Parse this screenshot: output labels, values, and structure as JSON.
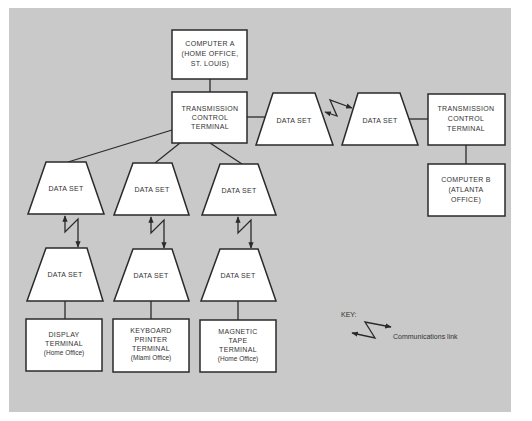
{
  "colors": {
    "background": "#ffffff",
    "panel": "#c9c9c9",
    "node_fill": "#ffffff",
    "stroke": "#2a2a2a",
    "text": "#333333"
  },
  "nodes": {
    "computer_a": {
      "lines": [
        "COMPUTER A",
        "(HOME OFFICE,",
        "ST. LOUIS)"
      ]
    },
    "tct_left": {
      "lines": [
        "TRANSMISSION",
        "CONTROL",
        "TERMINAL"
      ]
    },
    "data_set_top_left": {
      "label": "DATA SET"
    },
    "data_set_top_right": {
      "label": "DATA SET"
    },
    "tct_right": {
      "lines": [
        "TRANSMISSION",
        "CONTROL",
        "TERMINAL"
      ]
    },
    "computer_b": {
      "lines": [
        "COMPUTER B",
        "(ATLANTA",
        "OFFICE)"
      ]
    },
    "data_set_col1_upper": {
      "label": "DATA SET"
    },
    "data_set_col1_lower": {
      "label": "DATA SET"
    },
    "data_set_col2_upper": {
      "label": "DATA SET"
    },
    "data_set_col2_lower": {
      "label": "DATA SET"
    },
    "data_set_col3_upper": {
      "label": "DATA SET"
    },
    "data_set_col3_lower": {
      "label": "DATA SET"
    },
    "display_terminal": {
      "lines": [
        "DISPLAY",
        "TERMINAL",
        "(Home Office)"
      ]
    },
    "keyboard_printer_terminal": {
      "lines": [
        "KEYBOARD",
        "PRINTER",
        "TERMINAL",
        "(Miami Office)"
      ]
    },
    "magnetic_tape_terminal": {
      "lines": [
        "MAGNETIC",
        "TAPE",
        "TERMINAL",
        "(Home Office)"
      ]
    }
  },
  "edges": [
    {
      "from": "computer_a",
      "to": "tct_left",
      "type": "line"
    },
    {
      "from": "tct_left",
      "to": "data_set_top_left",
      "type": "line"
    },
    {
      "from": "data_set_top_left",
      "to": "data_set_top_right",
      "type": "communications-link"
    },
    {
      "from": "data_set_top_right",
      "to": "tct_right",
      "type": "line"
    },
    {
      "from": "tct_right",
      "to": "computer_b",
      "type": "line"
    },
    {
      "from": "tct_left",
      "to": "data_set_col1_upper",
      "type": "line"
    },
    {
      "from": "tct_left",
      "to": "data_set_col2_upper",
      "type": "line"
    },
    {
      "from": "tct_left",
      "to": "data_set_col3_upper",
      "type": "line"
    },
    {
      "from": "data_set_col1_upper",
      "to": "data_set_col1_lower",
      "type": "communications-link"
    },
    {
      "from": "data_set_col2_upper",
      "to": "data_set_col2_lower",
      "type": "communications-link"
    },
    {
      "from": "data_set_col3_upper",
      "to": "data_set_col3_lower",
      "type": "communications-link"
    },
    {
      "from": "data_set_col1_lower",
      "to": "display_terminal",
      "type": "line"
    },
    {
      "from": "data_set_col2_lower",
      "to": "keyboard_printer_terminal",
      "type": "line"
    },
    {
      "from": "data_set_col3_lower",
      "to": "magnetic_tape_terminal",
      "type": "line"
    }
  ],
  "key": {
    "title": "KEY:",
    "items": [
      {
        "icon": "zigzag-arrow-icon",
        "label": "Communications link"
      }
    ]
  }
}
